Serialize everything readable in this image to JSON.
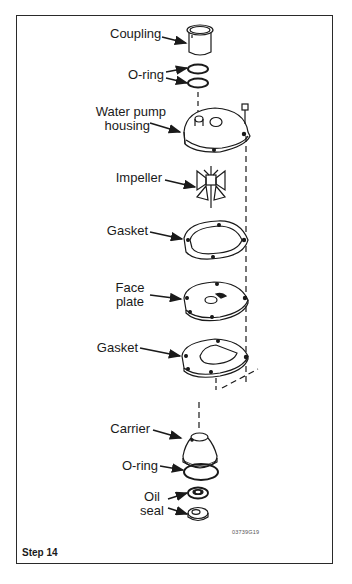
{
  "figure": {
    "step_label": "Step 14",
    "figure_code": "03739G19",
    "frame_color": "#2a2a2a",
    "line_color": "#1a1a1a"
  },
  "labels": {
    "coupling": "Coupling",
    "o_ring_top": "O-ring",
    "housing_line1": "Water pump",
    "housing_line2": "housing",
    "impeller": "Impeller",
    "gasket_upper": "Gasket",
    "face_plate_line1": "Face",
    "face_plate_line2": "plate",
    "gasket_lower": "Gasket",
    "carrier": "Carrier",
    "o_ring_bottom": "O-ring",
    "oil_seal_line1": "Oil",
    "oil_seal_line2": "seal"
  }
}
